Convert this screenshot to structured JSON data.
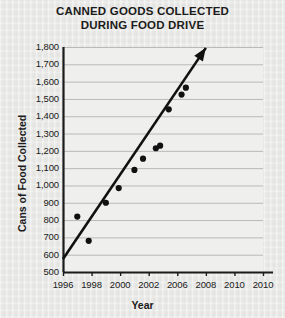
{
  "chart_data": {
    "type": "scatter",
    "title": "CANNED GOODS COLLECTED DURING FOOD DRIVE",
    "title_line1": "CANNED GOODS COLLECTED",
    "title_line2": "DURING FOOD DRIVE",
    "xlabel": "Year",
    "ylabel": "Cans of Food Collected",
    "xlim": [
      1996,
      2010
    ],
    "ylim": [
      500,
      1800
    ],
    "grid": true,
    "grid_axis": "y",
    "legend": false,
    "x_tick_labels": [
      "1996",
      "1998",
      "2000",
      "2002",
      "2006",
      "2008",
      "2010"
    ],
    "x_tick_values": [
      1996,
      1998,
      2000,
      2002,
      2004,
      2006,
      2008
    ],
    "y_tick_labels": [
      "500",
      "600",
      "700",
      "800",
      "900",
      "1,000",
      "1,100",
      "1,200",
      "1,300",
      "1,400",
      "1,500",
      "1,600",
      "1,700",
      "1,800"
    ],
    "y_tick_values": [
      500,
      600,
      700,
      800,
      900,
      1000,
      1100,
      1200,
      1300,
      1400,
      1500,
      1600,
      1700,
      1800
    ],
    "points": [
      {
        "x": 1997.0,
        "y": 820
      },
      {
        "x": 1997.8,
        "y": 680
      },
      {
        "x": 1999.0,
        "y": 900
      },
      {
        "x": 1999.9,
        "y": 985
      },
      {
        "x": 2001.0,
        "y": 1090
      },
      {
        "x": 2001.6,
        "y": 1155
      },
      {
        "x": 2002.5,
        "y": 1215
      },
      {
        "x": 2002.8,
        "y": 1230
      },
      {
        "x": 2003.4,
        "y": 1440
      },
      {
        "x": 2004.3,
        "y": 1525
      },
      {
        "x": 2004.6,
        "y": 1565
      }
    ],
    "trend_line": {
      "style": "solid-arrow",
      "start": {
        "x": 1996.0,
        "y": 575
      },
      "end": {
        "x": 2006.0,
        "y": 1795
      },
      "arrow": "up-right"
    },
    "colors": {
      "background": "#e9e9e7",
      "plot_area": "#efefed",
      "axis": "#1b1b1b",
      "gridline": "#b9b9b7",
      "point": "#111111",
      "trend": "#111111",
      "text": "#1b1b1b"
    }
  }
}
